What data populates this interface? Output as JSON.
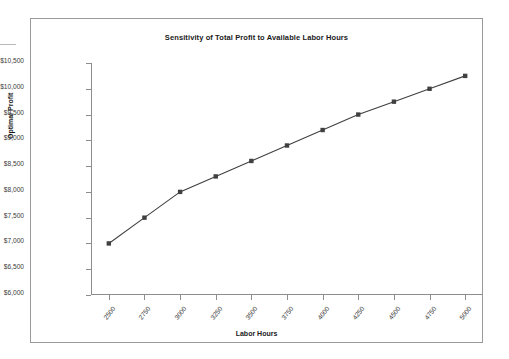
{
  "chart_data": {
    "type": "line",
    "title": "Sensitivity of Total Profit to Available Labor Hours",
    "xlabel": "Labor Hours",
    "ylabel": "Optimal Profit",
    "x": [
      2500,
      2750,
      3000,
      3250,
      3500,
      3750,
      4000,
      4250,
      4500,
      4750,
      5000
    ],
    "values": [
      7000,
      7500,
      8000,
      8300,
      8600,
      8900,
      9200,
      9500,
      9750,
      10000,
      10250
    ],
    "series": [
      {
        "name": "Optimal Profit",
        "values": [
          7000,
          7500,
          8000,
          8300,
          8600,
          8900,
          9200,
          9500,
          9750,
          10000,
          10250
        ]
      }
    ],
    "x_tick_labels": [
      "2500",
      "2750",
      "3000",
      "3250",
      "3500",
      "3750",
      "4000",
      "4250",
      "4500",
      "4750",
      "5000"
    ],
    "y_tick_labels": [
      "$6,000",
      "$6,500",
      "$7,000",
      "$7,500",
      "$8,000",
      "$8,500",
      "$9,000",
      "$9,500",
      "$10,000",
      "$10,500"
    ],
    "y_tick_values": [
      6000,
      6500,
      7000,
      7500,
      8000,
      8500,
      9000,
      9500,
      10000,
      10500
    ],
    "xlim": [
      2375,
      5125
    ],
    "ylim": [
      6000,
      10500
    ],
    "grid": false,
    "legend": "none",
    "marker": "square",
    "series_color": "#404040",
    "axis_color": "#8d8d8d",
    "text_color": "#1a1a1a",
    "background_color": "#ffffff",
    "border_color": "#9a9a9a"
  }
}
